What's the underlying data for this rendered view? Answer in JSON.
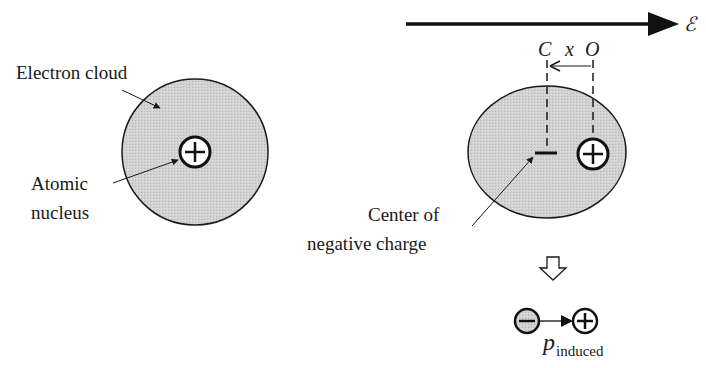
{
  "figure": {
    "left_atom": {
      "cloud_label": "Electron cloud",
      "nucleus_label_line1": "Atomic",
      "nucleus_label_line2": "nucleus",
      "nucleus_symbol": "+"
    },
    "right_atom": {
      "field_symbol": "ℰ",
      "label_c": "C",
      "label_x": "x",
      "label_o": "O",
      "center_label_line1": "Center of",
      "center_label_line2": "negative charge",
      "nucleus_symbol": "+"
    },
    "dipole": {
      "negative_symbol": "−",
      "positive_symbol": "+",
      "label_main": "p",
      "label_sub": "induced"
    },
    "colors": {
      "cloud_fill": "#cfcfcf",
      "stroke": "#1a1a1a",
      "background": "#ffffff"
    }
  }
}
